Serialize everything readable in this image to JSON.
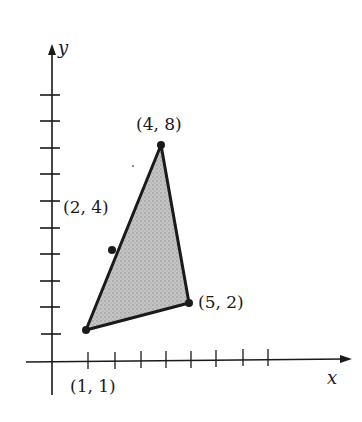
{
  "diagram": {
    "type": "coordinate-plane-triangle",
    "axes": {
      "x_label": "x",
      "y_label": "y",
      "x_ticks": 8,
      "y_ticks": 10
    },
    "vertices": [
      {
        "label": "(1, 1)",
        "x": 1,
        "y": 1
      },
      {
        "label": "(4, 8)",
        "x": 4,
        "y": 8
      },
      {
        "label": "(5, 2)",
        "x": 5,
        "y": 2
      }
    ],
    "edge_point": {
      "label": "(2, 4)",
      "x": 2,
      "y": 4
    },
    "colors": {
      "stroke": "#1a1a1a",
      "fill": "#bdbdbd",
      "background": "#ffffff"
    }
  }
}
